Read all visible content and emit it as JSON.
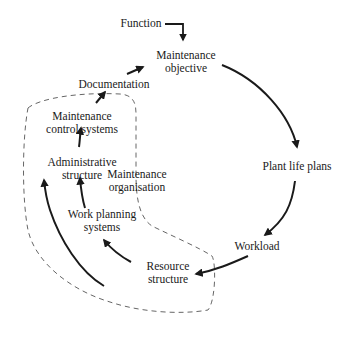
{
  "diagram": {
    "nodes": {
      "function": "Function",
      "maintenance_objective": [
        "Maintenance",
        "objective"
      ],
      "plant_life_plans": "Plant life plans",
      "workload": "Workload",
      "resource_structure": [
        "Resource",
        "structure"
      ],
      "work_planning_systems": [
        "Work planning",
        "systems"
      ],
      "administrative_structure": [
        "Administrative",
        "structure"
      ],
      "maintenance_control_systems": [
        "Maintenance",
        "control systems"
      ],
      "documentation": "Documentation",
      "maintenance_organisation": [
        "Maintenance",
        "organisation"
      ]
    },
    "edges": [
      {
        "from": "Function",
        "to": "Maintenance objective"
      },
      {
        "from": "Maintenance objective",
        "to": "Plant life plans"
      },
      {
        "from": "Plant life plans",
        "to": "Workload"
      },
      {
        "from": "Workload",
        "to": "Resource structure"
      },
      {
        "from": "Resource structure",
        "to": "Work planning systems"
      },
      {
        "from": "Work planning systems",
        "to": "Administrative structure"
      },
      {
        "from": "Administrative structure",
        "to": "Maintenance control systems"
      },
      {
        "from": "Maintenance control systems",
        "to": "Documentation"
      },
      {
        "from": "Documentation",
        "to": "Maintenance objective"
      },
      {
        "from": "Resource structure (outer loop)",
        "to": "Administrative structure"
      }
    ],
    "group": {
      "label": "Maintenance organisation",
      "style": "dashed",
      "members": [
        "Maintenance control systems",
        "Administrative structure",
        "Work planning systems",
        "Resource structure"
      ]
    },
    "colors": {
      "line": "#1a1a1a",
      "dashed_boundary": "#555555",
      "background": "#ffffff"
    }
  }
}
